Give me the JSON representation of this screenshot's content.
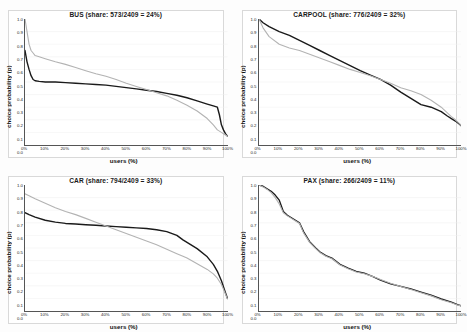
{
  "figure": {
    "axis_labels": {
      "x": "users (%)",
      "y": "choice probability (p)"
    },
    "colors": {
      "series_observed": "#1a1a1a",
      "series_predicted": "#b3b3b3",
      "grid": "#eeeeee",
      "axis": "#555555"
    },
    "xticks": [
      "0%",
      "10%",
      "20%",
      "30%",
      "40%",
      "50%",
      "60%",
      "70%",
      "80%",
      "90%",
      "100%"
    ],
    "yticks": [
      "1.0",
      "0.9",
      "0.8",
      "0.7",
      "0.6",
      "0.5",
      "0.4",
      "0.3",
      "0.2",
      "0.1",
      "0.0"
    ]
  },
  "panels": [
    {
      "id": "bus",
      "title": "BUS (share: 573/2409 = 24%)",
      "mode": "BUS",
      "count": 573,
      "total": 2409,
      "share_pct": 24
    },
    {
      "id": "carpool",
      "title": "CARPOOL (share: 776/2409 = 32%)",
      "mode": "CARPOOL",
      "count": 776,
      "total": 2409,
      "share_pct": 32
    },
    {
      "id": "car",
      "title": "CAR (share: 794/2409 = 33%)",
      "mode": "CAR",
      "count": 794,
      "total": 2409,
      "share_pct": 33
    },
    {
      "id": "pax",
      "title": "PAX (share: 266/2409 = 11%)",
      "mode": "PAX",
      "count": 266,
      "total": 2409,
      "share_pct": 11
    }
  ],
  "chart_data": [
    {
      "type": "line",
      "id": "bus",
      "title": "BUS (share: 573/2409 = 24%)",
      "xlabel": "users (%)",
      "ylabel": "choice probability (p)",
      "xlim": [
        0,
        100
      ],
      "ylim": [
        0,
        1
      ],
      "grid": true,
      "legend": "none",
      "x": [
        0,
        1,
        2,
        3,
        4,
        5,
        7,
        10,
        15,
        20,
        25,
        30,
        35,
        40,
        45,
        50,
        55,
        60,
        65,
        70,
        75,
        80,
        85,
        90,
        93,
        95,
        96,
        97,
        98,
        99,
        100
      ],
      "series": [
        {
          "name": "black-curve",
          "color": "#1a1a1a",
          "values": [
            0.75,
            0.66,
            0.6,
            0.55,
            0.52,
            0.51,
            0.505,
            0.5,
            0.5,
            0.495,
            0.49,
            0.485,
            0.48,
            0.475,
            0.465,
            0.455,
            0.445,
            0.435,
            0.425,
            0.41,
            0.395,
            0.375,
            0.35,
            0.325,
            0.31,
            0.3,
            0.24,
            0.16,
            0.12,
            0.09,
            0.07
          ]
        },
        {
          "name": "gray-curve",
          "color": "#b3b3b3",
          "values": [
            1.0,
            0.9,
            0.8,
            0.75,
            0.73,
            0.71,
            0.7,
            0.685,
            0.66,
            0.64,
            0.615,
            0.59,
            0.565,
            0.545,
            0.52,
            0.49,
            0.465,
            0.44,
            0.415,
            0.39,
            0.355,
            0.315,
            0.27,
            0.21,
            0.16,
            0.12,
            0.11,
            0.1,
            0.09,
            0.08,
            0.07
          ]
        }
      ]
    },
    {
      "type": "line",
      "id": "carpool",
      "title": "CARPOOL (share: 776/2409 = 32%)",
      "xlabel": "users (%)",
      "ylabel": "choice probability (p)",
      "xlim": [
        0,
        100
      ],
      "ylim": [
        0,
        1
      ],
      "grid": true,
      "legend": "none",
      "x": [
        0,
        2,
        5,
        10,
        15,
        20,
        25,
        30,
        35,
        40,
        45,
        50,
        55,
        60,
        65,
        70,
        75,
        80,
        85,
        90,
        93,
        95,
        97,
        99,
        100
      ],
      "series": [
        {
          "name": "black-curve",
          "color": "#1a1a1a",
          "values": [
            1.0,
            0.97,
            0.94,
            0.9,
            0.87,
            0.83,
            0.79,
            0.75,
            0.71,
            0.67,
            0.63,
            0.59,
            0.555,
            0.52,
            0.475,
            0.42,
            0.37,
            0.32,
            0.3,
            0.265,
            0.23,
            0.21,
            0.19,
            0.165,
            0.15
          ]
        },
        {
          "name": "gray-curve",
          "color": "#b3b3b3",
          "values": [
            1.0,
            0.93,
            0.86,
            0.8,
            0.77,
            0.75,
            0.72,
            0.69,
            0.66,
            0.63,
            0.6,
            0.575,
            0.55,
            0.52,
            0.49,
            0.455,
            0.43,
            0.4,
            0.355,
            0.3,
            0.255,
            0.225,
            0.2,
            0.17,
            0.15
          ]
        }
      ]
    },
    {
      "type": "line",
      "id": "car",
      "title": "CAR (share: 794/2409 = 33%)",
      "xlabel": "users (%)",
      "ylabel": "choice probability (p)",
      "xlim": [
        0,
        100
      ],
      "ylim": [
        0,
        1
      ],
      "grid": true,
      "legend": "none",
      "x": [
        0,
        2,
        5,
        10,
        15,
        20,
        25,
        30,
        35,
        40,
        45,
        50,
        55,
        60,
        65,
        70,
        75,
        78,
        80,
        85,
        90,
        93,
        95,
        97,
        99,
        100
      ],
      "series": [
        {
          "name": "black-curve",
          "color": "#1a1a1a",
          "values": [
            0.78,
            0.765,
            0.745,
            0.72,
            0.705,
            0.695,
            0.69,
            0.685,
            0.68,
            0.675,
            0.67,
            0.665,
            0.66,
            0.655,
            0.645,
            0.63,
            0.6,
            0.565,
            0.545,
            0.495,
            0.43,
            0.37,
            0.315,
            0.24,
            0.145,
            0.1
          ]
        },
        {
          "name": "gray-curve",
          "color": "#b3b3b3",
          "values": [
            0.93,
            0.915,
            0.89,
            0.855,
            0.82,
            0.79,
            0.765,
            0.735,
            0.705,
            0.675,
            0.645,
            0.615,
            0.585,
            0.555,
            0.525,
            0.49,
            0.455,
            0.435,
            0.42,
            0.375,
            0.33,
            0.295,
            0.26,
            0.21,
            0.135,
            0.095
          ]
        }
      ]
    },
    {
      "type": "line",
      "id": "pax",
      "title": "PAX (share: 266/2409 = 11%)",
      "xlabel": "users (%)",
      "ylabel": "choice probability (p)",
      "xlim": [
        0,
        100
      ],
      "ylim": [
        0,
        1
      ],
      "grid": true,
      "legend": "none",
      "x": [
        0,
        2,
        4,
        6,
        8,
        10,
        12,
        14,
        16,
        18,
        20,
        22,
        25,
        28,
        30,
        33,
        36,
        40,
        44,
        48,
        52,
        56,
        60,
        65,
        70,
        75,
        80,
        85,
        90,
        95,
        98,
        100
      ],
      "series": [
        {
          "name": "black-curve",
          "color": "#1a1a1a",
          "values": [
            1.0,
            0.99,
            0.97,
            0.95,
            0.92,
            0.88,
            0.79,
            0.76,
            0.74,
            0.72,
            0.7,
            0.63,
            0.55,
            0.5,
            0.47,
            0.44,
            0.42,
            0.37,
            0.34,
            0.315,
            0.3,
            0.275,
            0.245,
            0.215,
            0.195,
            0.175,
            0.15,
            0.125,
            0.095,
            0.07,
            0.05,
            0.04
          ]
        },
        {
          "name": "gray-curve",
          "color": "#b3b3b3",
          "values": [
            1.0,
            0.985,
            0.965,
            0.94,
            0.9,
            0.85,
            0.78,
            0.755,
            0.735,
            0.715,
            0.695,
            0.62,
            0.545,
            0.495,
            0.465,
            0.435,
            0.415,
            0.365,
            0.335,
            0.31,
            0.295,
            0.275,
            0.25,
            0.22,
            0.195,
            0.17,
            0.145,
            0.12,
            0.09,
            0.065,
            0.048,
            0.04
          ]
        }
      ]
    }
  ]
}
